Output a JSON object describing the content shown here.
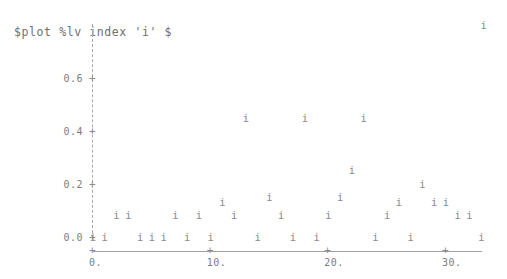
{
  "title": "$plot %lv index 'i' $",
  "colors": {
    "ink": "#8a8a8a",
    "axis": "#a0a0a0",
    "background": "#ffffff"
  },
  "marker": "i",
  "axes": {
    "y": {
      "ticks": [
        "0.0",
        "0.2",
        "0.4",
        "0.6"
      ],
      "tick_values": [
        0.0,
        0.2,
        0.4,
        0.6
      ],
      "tick_glyph": "+",
      "style": "dashed",
      "range": [
        0.0,
        0.72
      ]
    },
    "x": {
      "ticks": [
        "0.",
        "10.",
        "20.",
        "30."
      ],
      "tick_values": [
        0,
        10,
        20,
        30
      ],
      "tick_glyph": "+",
      "style": "solid",
      "range": [
        -1,
        34
      ]
    }
  },
  "chart_data": {
    "type": "scatter",
    "title": "$plot %lv index 'i' $",
    "xlabel": "",
    "ylabel": "",
    "xlim": [
      -1,
      34
    ],
    "ylim": [
      0.0,
      0.72
    ],
    "grid": false,
    "legend": null,
    "marker_glyph": "i",
    "x": [
      0,
      1,
      2,
      3,
      4,
      5,
      6,
      7,
      8,
      9,
      10,
      11,
      12,
      13,
      14,
      15,
      16,
      17,
      18,
      19,
      20,
      21,
      22,
      23,
      24,
      25,
      26,
      27,
      28,
      29,
      30,
      31,
      32,
      33
    ],
    "y": [
      0.0,
      0.0,
      0.08,
      0.08,
      0.0,
      0.0,
      0.0,
      0.08,
      0.0,
      0.08,
      0.0,
      0.13,
      0.08,
      0.45,
      0.0,
      0.15,
      0.08,
      0.0,
      0.45,
      0.0,
      0.08,
      0.15,
      0.25,
      0.45,
      0.0,
      0.08,
      0.13,
      0.0,
      0.2,
      0.13,
      0.13,
      0.08,
      0.08,
      0.0
    ],
    "outlier": {
      "x": 33.2,
      "y": 0.8,
      "note": "isolated point near top-right of frame"
    },
    "categories": null,
    "ytick_labels": [
      "0.0",
      "0.2",
      "0.4",
      "0.6"
    ],
    "xtick_labels": [
      "0.",
      "10.",
      "20.",
      "30."
    ]
  }
}
